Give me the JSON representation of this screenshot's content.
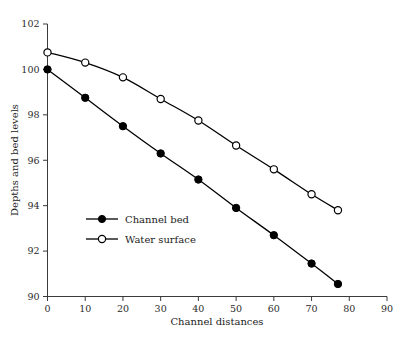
{
  "chart_data": {
    "type": "line",
    "title": "",
    "subtitle": "",
    "xlabel": "Channel distances",
    "ylabel": "Depths and bed levels",
    "xlim": [
      0,
      90
    ],
    "ylim": [
      90,
      102
    ],
    "xticks": [
      0,
      10,
      20,
      30,
      40,
      50,
      60,
      70,
      80,
      90
    ],
    "yticks": [
      90,
      92,
      94,
      96,
      98,
      100,
      102
    ],
    "xtick_labels": [
      "0",
      "10",
      "20",
      "30",
      "40",
      "50",
      "60",
      "70",
      "80",
      "90"
    ],
    "ytick_labels": [
      "90",
      "92",
      "94",
      "96",
      "98",
      "100",
      "102"
    ],
    "grid": false,
    "legend_position": "inside-lower-left",
    "series": [
      {
        "name": "Channel bed",
        "marker": "filled-circle",
        "color": "#000000",
        "x": [
          0,
          10,
          20,
          30,
          40,
          50,
          60,
          70,
          77
        ],
        "values": [
          100.0,
          98.75,
          97.5,
          96.3,
          95.15,
          93.9,
          92.7,
          91.45,
          90.55
        ]
      },
      {
        "name": "Water surface",
        "marker": "open-circle",
        "color": "#000000",
        "x": [
          0,
          10,
          20,
          30,
          40,
          50,
          60,
          70,
          77
        ],
        "values": [
          100.75,
          100.3,
          99.65,
          98.7,
          97.75,
          96.65,
          95.6,
          94.5,
          93.8
        ]
      }
    ]
  },
  "legend": {
    "entries": [
      {
        "label": "Channel bed",
        "marker": "filled-circle"
      },
      {
        "label": "Water surface",
        "marker": "open-circle"
      }
    ]
  },
  "axes": {
    "x_title": "Channel distances",
    "y_title": "Depths and bed levels"
  }
}
